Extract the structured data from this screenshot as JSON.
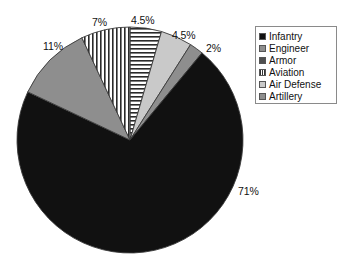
{
  "chart_data": {
    "type": "pie",
    "title": "",
    "categories": [
      "Infantry",
      "Engineer",
      "Armor",
      "Aviation",
      "Air Defense",
      "Artillery"
    ],
    "values": [
      71,
      11,
      4.5,
      7,
      4.5,
      2
    ],
    "value_labels": [
      "71%",
      "11%",
      "4.5%",
      "7%",
      "4.5%",
      "2%"
    ],
    "units": "percent",
    "legend_position": "right",
    "grid": false,
    "start_angle_deg": 0,
    "direction": "clockwise",
    "slices": [
      {
        "name": "Air Defense",
        "value": 4.5,
        "label": "4.5%",
        "fill": "horizontal-stripes",
        "swatch_class": "sw-hstripe"
      },
      {
        "name": "Armor",
        "value": 4.5,
        "label": "4.5%",
        "fill": "light-gray",
        "swatch_class": "sw-solid-ltgray"
      },
      {
        "name": "Artillery",
        "value": 2,
        "label": "2%",
        "fill": "medium-gray",
        "swatch_class": "sw-solid-mdgray"
      },
      {
        "name": "Infantry",
        "value": 71,
        "label": "71%",
        "fill": "black",
        "swatch_class": "sw-solid-black"
      },
      {
        "name": "Engineer",
        "value": 11,
        "label": "11%",
        "fill": "medium-gray",
        "swatch_class": "sw-solid-mdgray"
      },
      {
        "name": "Aviation",
        "value": 7,
        "label": "7%",
        "fill": "vertical-stripes",
        "swatch_class": "sw-vstripe"
      }
    ],
    "colors": {
      "black": "#111111",
      "dark_gray": "#4f4f4f",
      "medium_gray": "#8e8e8e",
      "light_gray": "#c9c9c9",
      "outline": "#555555",
      "background": "#ffffff"
    }
  },
  "labels": [
    {
      "text": "7%",
      "x": 92,
      "y": 16
    },
    {
      "text": "4.5%",
      "x": 131,
      "y": 14
    },
    {
      "text": "4.5%",
      "x": 172,
      "y": 29
    },
    {
      "text": "2%",
      "x": 206,
      "y": 42
    },
    {
      "text": "71%",
      "x": 238,
      "y": 185
    },
    {
      "text": "11%",
      "x": 43,
      "y": 40
    }
  ],
  "legend": {
    "items": [
      {
        "label": "Infantry",
        "swatch_class": "sw-solid-black"
      },
      {
        "label": "Engineer",
        "swatch_class": "sw-solid-mdgray"
      },
      {
        "label": "Armor",
        "swatch_class": "sw-solid-dkgray"
      },
      {
        "label": "Aviation",
        "swatch_class": "sw-vstripe"
      },
      {
        "label": "Air Defense",
        "swatch_class": "sw-solid-ltgray"
      },
      {
        "label": "Artillery",
        "swatch_class": "sw-solid-mdgray"
      }
    ]
  }
}
